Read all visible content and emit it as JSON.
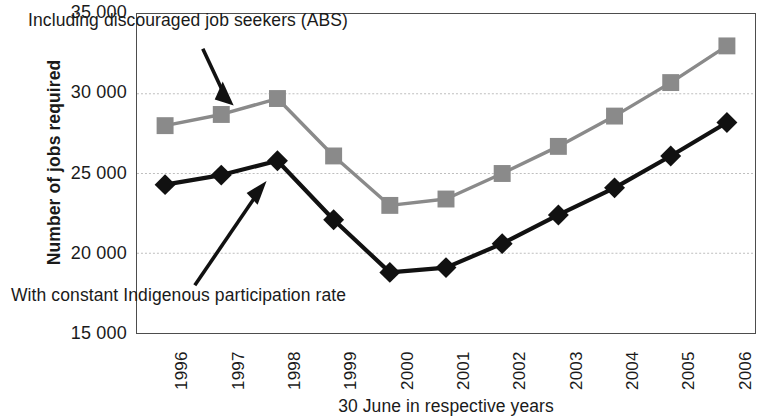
{
  "chart_data": {
    "type": "line",
    "title": "",
    "xlabel": "30 June in respective years",
    "ylabel": "Number of jobs required",
    "categories": [
      "1996",
      "1997",
      "1998",
      "1999",
      "2000",
      "2001",
      "2002",
      "2003",
      "2004",
      "2005",
      "2006"
    ],
    "x": [
      1996,
      1997,
      1998,
      1999,
      2000,
      2001,
      2002,
      2003,
      2004,
      2005,
      2006
    ],
    "ylim": [
      15000,
      35000
    ],
    "ytick_labels": [
      "35 000",
      "30 000",
      "25 000",
      "20 000",
      "15 000"
    ],
    "yticks": [
      35000,
      30000,
      25000,
      20000,
      15000
    ],
    "grid": true,
    "legend_position": "none",
    "series": [
      {
        "name": "Including discouraged job seekers (ABS)",
        "marker": "square",
        "color": "#8a8a8a",
        "values": [
          28000,
          28700,
          29700,
          26100,
          23000,
          23400,
          25000,
          26700,
          28600,
          30700,
          33000
        ]
      },
      {
        "name": "With constant Indigenous participation rate",
        "marker": "diamond",
        "color": "#111111",
        "values": [
          24300,
          24900,
          25800,
          22100,
          18800,
          19100,
          20600,
          22400,
          24100,
          26100,
          28200
        ]
      }
    ],
    "annotations": [
      {
        "id": "annotation-top",
        "text": "Including discouraged job seekers (ABS)",
        "points_to": "1998 square marker"
      },
      {
        "id": "annotation-bottom",
        "text": "With constant Indigenous participation rate",
        "points_to": "1998 diamond marker"
      }
    ]
  },
  "axes": {
    "y_title": "Number of jobs required",
    "x_title": "30 June in respective years"
  }
}
